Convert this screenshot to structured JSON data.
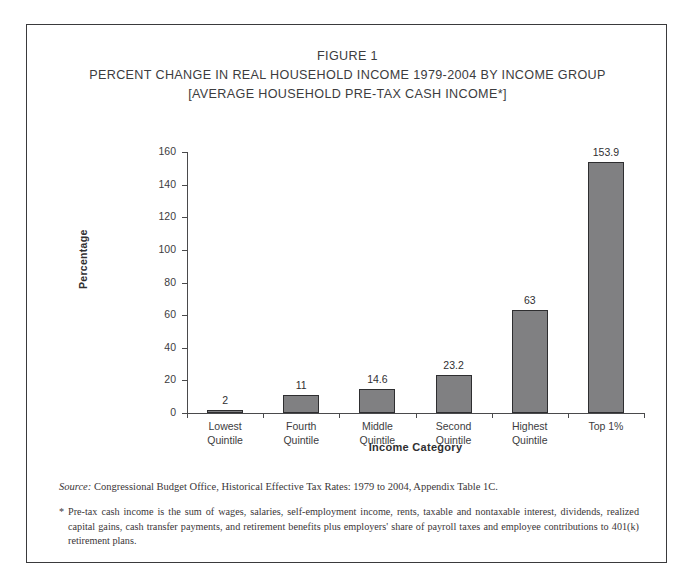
{
  "figure": {
    "title_lines": [
      "FIGURE 1",
      "PERCENT CHANGE IN REAL HOUSEHOLD INCOME 1979-2004 BY INCOME GROUP",
      "[AVERAGE HOUSEHOLD PRE-TAX CASH INCOME*]"
    ]
  },
  "chart_data": {
    "type": "bar",
    "title": "PERCENT CHANGE IN REAL HOUSEHOLD INCOME 1979-2004 BY INCOME GROUP",
    "subtitle": "[AVERAGE HOUSEHOLD PRE-TAX CASH INCOME*]",
    "categories": [
      "Lowest Quintile",
      "Fourth Quintile",
      "Middle Quintile",
      "Second Quintile",
      "Highest Quintile",
      "Top 1%"
    ],
    "category_lines": [
      [
        "Lowest",
        "Quintile"
      ],
      [
        "Fourth",
        "Quintile"
      ],
      [
        "Middle",
        "Quintile"
      ],
      [
        "Second",
        "Quintile"
      ],
      [
        "Highest",
        "Quintile"
      ],
      [
        "Top 1%",
        ""
      ]
    ],
    "values": [
      2,
      11,
      14.6,
      23.2,
      63,
      153.9
    ],
    "value_labels": [
      "2",
      "11",
      "14.6",
      "23.2",
      "63",
      "153.9"
    ],
    "xlabel": "Income Category",
    "ylabel": "Percentage",
    "ylim": [
      0,
      160
    ],
    "yticks": [
      0,
      20,
      40,
      60,
      80,
      100,
      120,
      140,
      160
    ],
    "ytick_labels": [
      "0",
      "20",
      "40",
      "60",
      "80",
      "100",
      "120",
      "140",
      "160"
    ],
    "grid": false,
    "legend": null,
    "bar_color": "#808082",
    "bar_edge_color": "#2e2e30"
  },
  "notes": {
    "source_label": "Source:",
    "source_text": "Congressional Budget Office, Historical Effective Tax Rates: 1979 to 2004, Appendix Table 1C.",
    "star_symbol": "*",
    "star_text": "Pre-tax cash income is the sum of wages, salaries, self-employment income, rents, taxable and nontaxable interest, dividends, realized capital gains, cash transfer payments, and retirement benefits plus employers' share of payroll taxes and employee contributions to 401(k) retirement plans."
  }
}
